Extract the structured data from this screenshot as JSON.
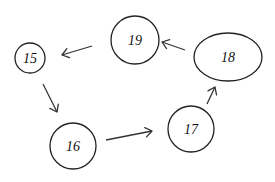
{
  "diagram": {
    "type": "directed-graph",
    "colors": {
      "stroke": "#222222",
      "background": "#ffffff",
      "text": "#111111"
    },
    "nodes": [
      {
        "id": "15",
        "label": "15",
        "shape": "circle",
        "cx": 30,
        "cy": 58,
        "rx": 15,
        "ry": 15
      },
      {
        "id": "19",
        "label": "19",
        "shape": "circle",
        "cx": 135,
        "cy": 40,
        "rx": 24,
        "ry": 24
      },
      {
        "id": "18",
        "label": "18",
        "shape": "ellipse",
        "cx": 228,
        "cy": 57,
        "rx": 34,
        "ry": 24
      },
      {
        "id": "16",
        "label": "16",
        "shape": "circle",
        "cx": 73,
        "cy": 146,
        "rx": 23,
        "ry": 23
      },
      {
        "id": "17",
        "label": "17",
        "shape": "circle",
        "cx": 191,
        "cy": 129,
        "rx": 23,
        "ry": 23
      }
    ],
    "edges": [
      {
        "from": "18",
        "to": "19",
        "x1": 185,
        "y1": 50,
        "x2": 162,
        "y2": 42
      },
      {
        "from": "19",
        "to": "15",
        "x1": 92,
        "y1": 46,
        "x2": 62,
        "y2": 55
      },
      {
        "from": "15",
        "to": "16",
        "x1": 43,
        "y1": 84,
        "x2": 57,
        "y2": 112
      },
      {
        "from": "16",
        "to": "17",
        "x1": 106,
        "y1": 140,
        "x2": 152,
        "y2": 131
      },
      {
        "from": "17",
        "to": "18",
        "x1": 207,
        "y1": 104,
        "x2": 215,
        "y2": 87
      }
    ]
  }
}
